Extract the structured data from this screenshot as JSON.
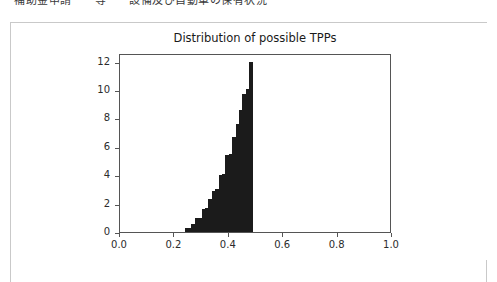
{
  "page": {
    "clipped_header_text": "補助金申請　　等　　設備及び自動車の保有状況"
  },
  "chart_data": {
    "type": "bar",
    "title": "Distribution of possible TPPs",
    "xlabel": "",
    "ylabel": "",
    "grid": false,
    "legend": null,
    "xlim": [
      0.0,
      1.0
    ],
    "ylim": [
      0.0,
      12.6
    ],
    "xticks": [
      "0.0",
      "0.2",
      "0.4",
      "0.6",
      "0.8",
      "1.0"
    ],
    "xtick_values": [
      0.0,
      0.2,
      0.4,
      0.6,
      0.8,
      1.0
    ],
    "yticks": [
      "0",
      "2",
      "4",
      "6",
      "8",
      "10",
      "12"
    ],
    "ytick_values": [
      0,
      2,
      4,
      6,
      8,
      10,
      12
    ],
    "bar_color": "#1b1b1b",
    "bin_width": 0.0125,
    "bin_left_edges": [
      0.2375,
      0.25,
      0.2625,
      0.275,
      0.2875,
      0.3,
      0.3125,
      0.325,
      0.3375,
      0.35,
      0.3625,
      0.375,
      0.3875,
      0.4,
      0.4125,
      0.425,
      0.4375,
      0.45,
      0.4625,
      0.475
    ],
    "values": [
      0.28,
      0.28,
      0.55,
      1.0,
      1.0,
      1.6,
      1.7,
      2.3,
      2.9,
      3.0,
      4.0,
      4.1,
      5.4,
      5.5,
      6.7,
      7.6,
      8.6,
      9.7,
      10.1,
      12.0
    ]
  }
}
